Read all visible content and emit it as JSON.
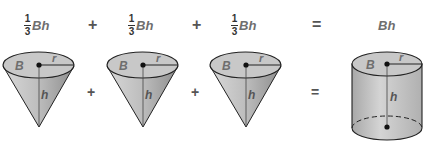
{
  "equation": {
    "terms": [
      {
        "numerator": "1",
        "denominator": "3",
        "expr": "Bh"
      },
      {
        "numerator": "1",
        "denominator": "3",
        "expr": "Bh"
      },
      {
        "numerator": "1",
        "denominator": "3",
        "expr": "Bh"
      }
    ],
    "plus": "+",
    "equals": "=",
    "result": "Bh"
  },
  "figures": {
    "cone_labels": {
      "base": "B",
      "radius": "r",
      "height": "h"
    },
    "cylinder_labels": {
      "base": "B",
      "radius": "r",
      "height": "h"
    },
    "plus": "+",
    "equals": "="
  },
  "colors": {
    "fill": "#c8c8c8",
    "side_dark": "#9a9a9a",
    "stroke": "#222222",
    "label": "#6e6e6e"
  }
}
